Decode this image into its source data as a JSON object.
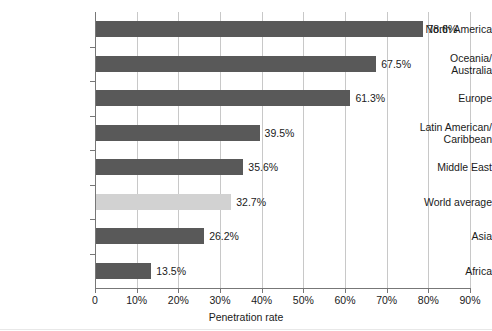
{
  "chart_data": {
    "type": "bar",
    "orientation": "horizontal",
    "title": "",
    "xlabel": "Penetration rate",
    "ylabel": "",
    "xlim": [
      0,
      90
    ],
    "grid": true,
    "legend": false,
    "xticks": [
      "0",
      "10%",
      "20%",
      "30%",
      "40%",
      "50%",
      "60%",
      "70%",
      "80%",
      "90%"
    ],
    "xtick_values": [
      0,
      10,
      20,
      30,
      40,
      50,
      60,
      70,
      80,
      90
    ],
    "categories": [
      "North America",
      "Oceania/ Australia",
      "Europe",
      "Latin American/ Caribbean",
      "Middle East",
      "World average",
      "Asia",
      "Africa"
    ],
    "values": [
      78.6,
      67.5,
      61.3,
      39.5,
      35.6,
      32.7,
      26.2,
      13.5
    ],
    "value_labels": [
      "78.6%",
      "67.5%",
      "61.3%",
      "39.5%",
      "35.6%",
      "32.7%",
      "26.2%",
      "13.5%"
    ],
    "bars": [
      {
        "category_lines": [
          "North America"
        ],
        "value": 78.6,
        "label": "78.6%",
        "highlight": false
      },
      {
        "category_lines": [
          "Oceania/",
          "Australia"
        ],
        "value": 67.5,
        "label": "67.5%",
        "highlight": false
      },
      {
        "category_lines": [
          "Europe"
        ],
        "value": 61.3,
        "label": "61.3%",
        "highlight": false
      },
      {
        "category_lines": [
          "Latin American/",
          "Caribbean"
        ],
        "value": 39.5,
        "label": "39.5%",
        "highlight": false
      },
      {
        "category_lines": [
          "Middle East"
        ],
        "value": 35.6,
        "label": "35.6%",
        "highlight": false
      },
      {
        "category_lines": [
          "World average"
        ],
        "value": 32.7,
        "label": "32.7%",
        "highlight": true
      },
      {
        "category_lines": [
          "Asia"
        ],
        "value": 26.2,
        "label": "26.2%",
        "highlight": false
      },
      {
        "category_lines": [
          "Africa"
        ],
        "value": 13.5,
        "label": "13.5%",
        "highlight": false
      }
    ],
    "colors": {
      "bar": "#595959",
      "bar_highlight": "#d2d2d2",
      "gridline": "#c8c8c8",
      "axis": "#777777",
      "text": "#1a1a1a",
      "background": "#ffffff"
    }
  }
}
